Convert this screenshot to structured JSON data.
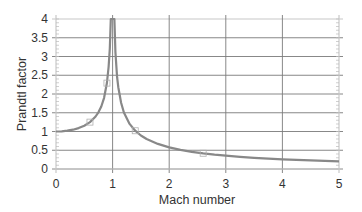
{
  "chart_data": {
    "type": "line",
    "title": "",
    "xlabel": "Mach number",
    "ylabel": "Prandtl factor",
    "xlim": [
      0,
      5
    ],
    "ylim": [
      0,
      4
    ],
    "xticks": [
      0,
      1,
      2,
      3,
      4,
      5
    ],
    "yticks": [
      0,
      0.5,
      1,
      1.5,
      2,
      2.5,
      3,
      3.5,
      4
    ],
    "ytick_labels": [
      "0",
      "0.5",
      "1",
      "1.5",
      "2",
      "2.5",
      "3",
      "3.5",
      "4"
    ],
    "xtick_labels": [
      "0",
      "1",
      "2",
      "3",
      "4",
      "5"
    ],
    "grid": true,
    "legend": null,
    "series": [
      {
        "name": "Prandtl factor",
        "color": "#888888",
        "x": [
          0,
          0.1,
          0.2,
          0.3,
          0.4,
          0.5,
          0.6,
          0.7,
          0.75,
          0.8,
          0.85,
          0.9,
          0.93,
          0.95,
          0.968,
          0.968,
          1.032,
          1.032,
          1.05,
          1.08,
          1.1,
          1.15,
          1.2,
          1.3,
          1.4,
          1.5,
          1.6,
          1.8,
          2.0,
          2.2,
          2.4,
          2.6,
          2.8,
          3.0,
          3.25,
          3.5,
          3.75,
          4.0,
          4.25,
          4.5,
          4.75,
          5.0
        ],
        "values": [
          1.0,
          1.005,
          1.021,
          1.048,
          1.091,
          1.155,
          1.25,
          1.4,
          1.512,
          1.667,
          1.898,
          2.294,
          2.72,
          3.203,
          4.0,
          4.0,
          4.0,
          4.0,
          3.123,
          2.449,
          2.182,
          1.768,
          1.508,
          1.202,
          1.021,
          0.894,
          0.801,
          0.668,
          0.577,
          0.51,
          0.458,
          0.417,
          0.382,
          0.354,
          0.323,
          0.298,
          0.278,
          0.258,
          0.242,
          0.229,
          0.216,
          0.204
        ]
      }
    ],
    "markers": [
      {
        "x": 0.6,
        "y": 1.25
      },
      {
        "x": 0.9,
        "y": 2.29
      },
      {
        "x": 1.4,
        "y": 1.02
      },
      {
        "x": 2.6,
        "y": 0.42
      }
    ]
  }
}
